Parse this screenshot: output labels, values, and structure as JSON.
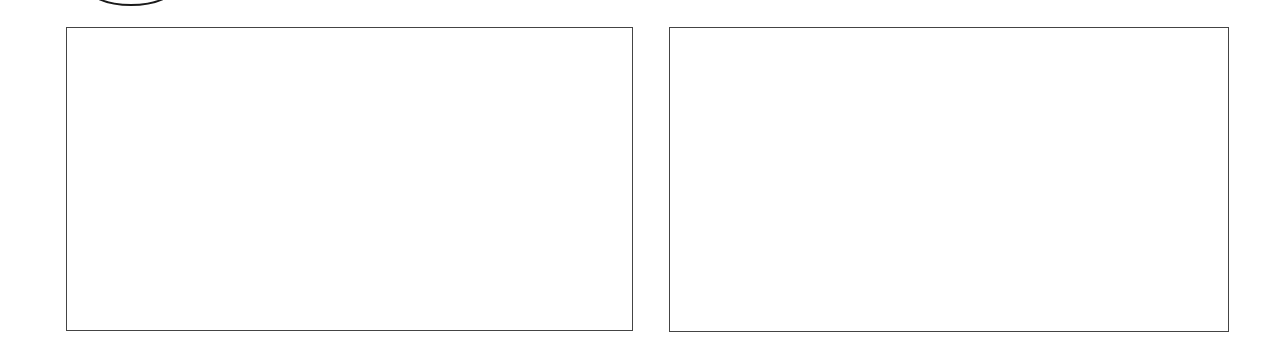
{
  "diagram": {
    "shapes": [
      {
        "type": "ellipse",
        "name": "top-ellipse",
        "label": ""
      },
      {
        "type": "rectangle",
        "name": "left-panel",
        "label": ""
      },
      {
        "type": "rectangle",
        "name": "right-panel",
        "label": ""
      }
    ],
    "colors": {
      "stroke": "#444444",
      "background": "#ffffff"
    }
  }
}
